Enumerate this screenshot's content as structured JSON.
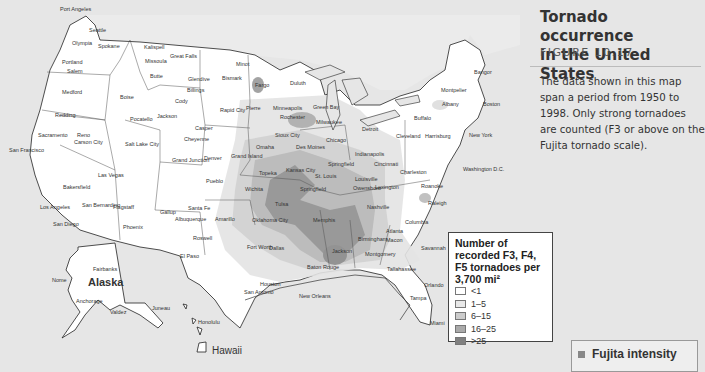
{
  "sidebar": {
    "title_line1": "Tornado occurrence",
    "title_line2": "in the United States",
    "figure": "FIGURE 10.17",
    "description": "The data shown in this map span a period from 1950 to 1998. Only strong tornadoes are counted (F3 or above on the Fujita tornado scale).",
    "next_box_label": "Fujita intensity"
  },
  "legend": {
    "title": "Number of recorded F3, F4, F5 tornadoes per 3,700 mi²",
    "items": [
      {
        "label": "<1",
        "color": "#ffffff"
      },
      {
        "label": "1–5",
        "color": "#e8e8e8"
      },
      {
        "label": "6–15",
        "color": "#cccccc"
      },
      {
        "label": "16–25",
        "color": "#aaaaaa"
      },
      {
        "label": ">25",
        "color": "#808080"
      }
    ]
  },
  "map": {
    "regions": {
      "alaska": "Alaska",
      "hawaii": "Hawaii"
    },
    "cities": [
      {
        "name": "Port Angeles",
        "x": 60,
        "y": 7
      },
      {
        "name": "Seattle",
        "x": 89,
        "y": 28
      },
      {
        "name": "Olympia",
        "x": 72,
        "y": 41
      },
      {
        "name": "Spokane",
        "x": 98,
        "y": 44
      },
      {
        "name": "Kalispell",
        "x": 144,
        "y": 45
      },
      {
        "name": "Great Falls",
        "x": 170,
        "y": 54
      },
      {
        "name": "Missoula",
        "x": 145,
        "y": 59
      },
      {
        "name": "Butte",
        "x": 150,
        "y": 74
      },
      {
        "name": "Portland",
        "x": 62,
        "y": 60
      },
      {
        "name": "Salem",
        "x": 67,
        "y": 69
      },
      {
        "name": "Medford",
        "x": 62,
        "y": 90
      },
      {
        "name": "Boise",
        "x": 120,
        "y": 95
      },
      {
        "name": "Glendive",
        "x": 188,
        "y": 77
      },
      {
        "name": "Billings",
        "x": 187,
        "y": 88
      },
      {
        "name": "Minot",
        "x": 236,
        "y": 62
      },
      {
        "name": "Bismark",
        "x": 222,
        "y": 76
      },
      {
        "name": "Fargo",
        "x": 255,
        "y": 83
      },
      {
        "name": "Duluth",
        "x": 290,
        "y": 81
      },
      {
        "name": "Cody",
        "x": 175,
        "y": 99
      },
      {
        "name": "Jackson",
        "x": 157,
        "y": 114
      },
      {
        "name": "Pocatello",
        "x": 130,
        "y": 117
      },
      {
        "name": "Redding",
        "x": 55,
        "y": 113
      },
      {
        "name": "Rapid City",
        "x": 220,
        "y": 108
      },
      {
        "name": "Pierre",
        "x": 246,
        "y": 106
      },
      {
        "name": "Minneapolis",
        "x": 273,
        "y": 106
      },
      {
        "name": "Green Bay",
        "x": 313,
        "y": 105
      },
      {
        "name": "Rochester",
        "x": 280,
        "y": 115
      },
      {
        "name": "Milwaukee",
        "x": 316,
        "y": 120
      },
      {
        "name": "Montpelier",
        "x": 441,
        "y": 88
      },
      {
        "name": "Bangor",
        "x": 474,
        "y": 70
      },
      {
        "name": "Albany",
        "x": 442,
        "y": 102
      },
      {
        "name": "Boston",
        "x": 483,
        "y": 102
      },
      {
        "name": "Buffalo",
        "x": 414,
        "y": 116
      },
      {
        "name": "Casper",
        "x": 195,
        "y": 126
      },
      {
        "name": "Cheyenne",
        "x": 184,
        "y": 137
      },
      {
        "name": "Salt Lake City",
        "x": 125,
        "y": 142
      },
      {
        "name": "Sacramento",
        "x": 38,
        "y": 133
      },
      {
        "name": "Reno",
        "x": 77,
        "y": 133
      },
      {
        "name": "Carson City",
        "x": 74,
        "y": 140
      },
      {
        "name": "San Francisco",
        "x": 9,
        "y": 148
      },
      {
        "name": "Sioux City",
        "x": 275,
        "y": 133
      },
      {
        "name": "Chicago",
        "x": 326,
        "y": 138
      },
      {
        "name": "Detroit",
        "x": 362,
        "y": 127
      },
      {
        "name": "Cleveland",
        "x": 396,
        "y": 134
      },
      {
        "name": "Harrisburg",
        "x": 425,
        "y": 134
      },
      {
        "name": "New York",
        "x": 469,
        "y": 133
      },
      {
        "name": "Omaha",
        "x": 256,
        "y": 145
      },
      {
        "name": "Des Moines",
        "x": 296,
        "y": 145
      },
      {
        "name": "Grand Island",
        "x": 231,
        "y": 154
      },
      {
        "name": "Denver",
        "x": 204,
        "y": 156
      },
      {
        "name": "Grand Junction",
        "x": 172,
        "y": 158
      },
      {
        "name": "Indianapolis",
        "x": 355,
        "y": 152
      },
      {
        "name": "Cincinnati",
        "x": 374,
        "y": 162
      },
      {
        "name": "Washington D.C.",
        "x": 463,
        "y": 167
      },
      {
        "name": "Topeka",
        "x": 259,
        "y": 171
      },
      {
        "name": "Kansas City",
        "x": 286,
        "y": 168
      },
      {
        "name": "Springfield",
        "x": 328,
        "y": 162
      },
      {
        "name": "St. Louis",
        "x": 315,
        "y": 174
      },
      {
        "name": "Louisville",
        "x": 355,
        "y": 177
      },
      {
        "name": "Owensboro",
        "x": 353,
        "y": 186
      },
      {
        "name": "Lexington",
        "x": 375,
        "y": 185
      },
      {
        "name": "Charleston",
        "x": 400,
        "y": 170
      },
      {
        "name": "Roanoke",
        "x": 421,
        "y": 184
      },
      {
        "name": "Pueblo",
        "x": 206,
        "y": 179
      },
      {
        "name": "Wichita",
        "x": 245,
        "y": 187
      },
      {
        "name": "Springfield",
        "x": 300,
        "y": 187
      },
      {
        "name": "Bakersfield",
        "x": 63,
        "y": 185
      },
      {
        "name": "Las Vegas",
        "x": 98,
        "y": 173
      },
      {
        "name": "Tulsa",
        "x": 275,
        "y": 202
      },
      {
        "name": "Nashville",
        "x": 367,
        "y": 205
      },
      {
        "name": "Raleigh",
        "x": 428,
        "y": 201
      },
      {
        "name": "Santa Fe",
        "x": 188,
        "y": 206
      },
      {
        "name": "Gallup",
        "x": 160,
        "y": 210
      },
      {
        "name": "Albuquerque",
        "x": 175,
        "y": 217
      },
      {
        "name": "Amarillo",
        "x": 215,
        "y": 217
      },
      {
        "name": "Oklahoma City",
        "x": 252,
        "y": 218
      },
      {
        "name": "Memphis",
        "x": 313,
        "y": 218
      },
      {
        "name": "Flagstaff",
        "x": 113,
        "y": 205
      },
      {
        "name": "Los Angeles",
        "x": 40,
        "y": 205
      },
      {
        "name": "San Bernardino",
        "x": 82,
        "y": 203
      },
      {
        "name": "Columbia",
        "x": 405,
        "y": 220
      },
      {
        "name": "Phoenix",
        "x": 123,
        "y": 225
      },
      {
        "name": "San Diego",
        "x": 53,
        "y": 222
      },
      {
        "name": "Atlanta",
        "x": 386,
        "y": 229
      },
      {
        "name": "Birmingham",
        "x": 358,
        "y": 237
      },
      {
        "name": "Macon",
        "x": 386,
        "y": 238
      },
      {
        "name": "Roswell",
        "x": 193,
        "y": 236
      },
      {
        "name": "Fort Worth",
        "x": 247,
        "y": 245
      },
      {
        "name": "Dallas",
        "x": 269,
        "y": 246
      },
      {
        "name": "Jackson",
        "x": 332,
        "y": 249
      },
      {
        "name": "Montgomery",
        "x": 365,
        "y": 252
      },
      {
        "name": "Savannah",
        "x": 421,
        "y": 246
      },
      {
        "name": "El Paso",
        "x": 180,
        "y": 254
      },
      {
        "name": "Baton Rouge",
        "x": 307,
        "y": 265
      },
      {
        "name": "Tallahassee",
        "x": 387,
        "y": 267
      },
      {
        "name": "Houston",
        "x": 260,
        "y": 282
      },
      {
        "name": "San Antonio",
        "x": 244,
        "y": 290
      },
      {
        "name": "New Orleans",
        "x": 299,
        "y": 294
      },
      {
        "name": "Orlando",
        "x": 424,
        "y": 283
      },
      {
        "name": "Tampa",
        "x": 410,
        "y": 296
      },
      {
        "name": "Miami",
        "x": 430,
        "y": 321
      },
      {
        "name": "Fairbanks",
        "x": 93,
        "y": 267
      },
      {
        "name": "Nome",
        "x": 52,
        "y": 278
      },
      {
        "name": "Anchorage",
        "x": 76,
        "y": 299
      },
      {
        "name": "Valdez",
        "x": 110,
        "y": 310
      },
      {
        "name": "Juneau",
        "x": 152,
        "y": 306
      },
      {
        "name": "Honolulu",
        "x": 198,
        "y": 320
      }
    ]
  }
}
